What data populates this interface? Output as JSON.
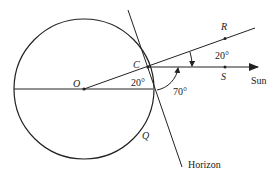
{
  "diagram": {
    "points": {
      "O": {
        "label": "O"
      },
      "C": {
        "label": "C"
      },
      "R": {
        "label": "R"
      },
      "S": {
        "label": "S"
      },
      "Q": {
        "label": "Q"
      }
    },
    "angles": {
      "angle_O": "20°",
      "angle_RCS": "20°",
      "angle_sun_horizon": "70°"
    },
    "labels": {
      "sun": "Sun",
      "horizon": "Horizon"
    },
    "colors": {
      "stroke": "#222222",
      "background": "#ffffff"
    }
  }
}
